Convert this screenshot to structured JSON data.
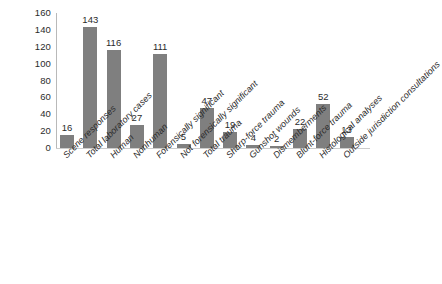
{
  "chart_data": {
    "type": "bar",
    "title": "",
    "subtitle": "",
    "xlabel": "",
    "ylabel": "",
    "ylim": [
      0,
      160
    ],
    "ytick_step": 20,
    "yticks": [
      160,
      140,
      120,
      100,
      80,
      60,
      40,
      20,
      0
    ],
    "grid": false,
    "legend": null,
    "legend_position": "none",
    "bar_color": "#7f7f7f",
    "label_rotation": -45,
    "categories": [
      "Scene responses",
      "Total laboratory cases",
      "Human",
      "Nonhuman",
      "Forensically significant",
      "Not forensically significant",
      "Total trauma",
      "Sharp-force trauma",
      "Gunshot wounds",
      "Dismemberments",
      "Blunt-force trauma",
      "Histological analyses",
      "Outside jurisdiction consultations"
    ],
    "values": [
      16,
      143,
      116,
      27,
      111,
      5,
      47,
      19,
      4,
      2,
      22,
      52,
      13
    ],
    "data_labels": [
      "16",
      "143",
      "116",
      "27",
      "111",
      "5",
      "47",
      "19",
      "4",
      "2",
      "22",
      "52",
      "13"
    ]
  }
}
